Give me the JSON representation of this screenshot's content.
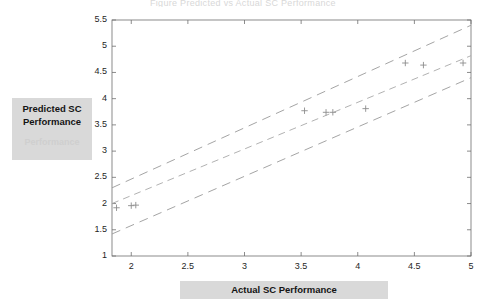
{
  "title_faint": "Figure  Predicted vs Actual SC Performance",
  "axes": {
    "ylabel": "Predicted SC\nPerformance",
    "ylabel_ghost": "Performance",
    "xlabel": "Actual SC Performance",
    "xtick_labels": [
      "2",
      "2.5",
      "3",
      "3.5",
      "4",
      "4.5",
      "5"
    ],
    "ytick_labels": [
      "1",
      "1.5",
      "2",
      "2.5",
      "3",
      "3.5",
      "4",
      "4.5",
      "5",
      "5.5"
    ]
  },
  "colors": {
    "axis": "#6e6e6e",
    "marker": "#8c8c8c",
    "fit_line": "#a8a8a8",
    "band_line": "#9a9a9a",
    "label_box": "#d9d9d9",
    "text": "#141414"
  },
  "chart_data": {
    "type": "scatter",
    "title": "",
    "xlabel": "Actual SC Performance",
    "ylabel": "Predicted SC Performance",
    "xlim": [
      1.83,
      5.0
    ],
    "ylim": [
      1.0,
      5.5
    ],
    "xticks": [
      2,
      2.5,
      3,
      3.5,
      4,
      4.5,
      5
    ],
    "yticks": [
      1,
      1.5,
      2,
      2.5,
      3,
      3.5,
      4,
      4.5,
      5,
      5.5
    ],
    "grid": false,
    "legend": "none",
    "marker": "plus",
    "points": [
      {
        "x": 1.87,
        "y": 1.92
      },
      {
        "x": 2.0,
        "y": 1.96
      },
      {
        "x": 2.04,
        "y": 1.97
      },
      {
        "x": 3.53,
        "y": 3.77
      },
      {
        "x": 3.72,
        "y": 3.74
      },
      {
        "x": 3.78,
        "y": 3.74
      },
      {
        "x": 4.07,
        "y": 3.81
      },
      {
        "x": 4.42,
        "y": 4.68
      },
      {
        "x": 4.58,
        "y": 4.64
      },
      {
        "x": 4.93,
        "y": 4.68
      }
    ],
    "series": [
      {
        "name": "fit line",
        "style": "dashed",
        "x": [
          1.83,
          5.0
        ],
        "values": [
          2.0,
          4.82
        ]
      },
      {
        "name": "upper confidence band",
        "style": "dashed",
        "x": [
          1.83,
          5.0
        ],
        "values": [
          2.3,
          5.4
        ]
      },
      {
        "name": "lower confidence band",
        "style": "dashed",
        "x": [
          1.83,
          5.0
        ],
        "values": [
          1.42,
          4.4
        ]
      }
    ]
  }
}
